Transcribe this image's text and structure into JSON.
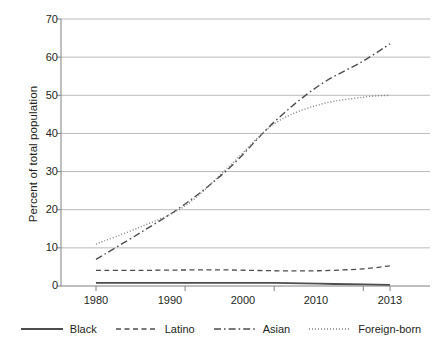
{
  "chart_data": {
    "type": "line",
    "title": "",
    "xlabel": "",
    "ylabel": "Percent of total population",
    "xlim": [
      1980,
      2013
    ],
    "ylim": [
      0,
      70
    ],
    "yticks": [
      0,
      10,
      20,
      30,
      40,
      50,
      60,
      70
    ],
    "xticks": [
      1980,
      1990,
      2000,
      2010,
      2013
    ],
    "grid": "horizontal",
    "legend_position": "bottom",
    "x": [
      1980,
      1985,
      1990,
      1995,
      2000,
      2005,
      2010,
      2013
    ],
    "series": [
      {
        "name": "Black",
        "style": "solid",
        "color": "#4d4d4d",
        "values": [
          0.8,
          0.8,
          0.8,
          0.8,
          0.8,
          0.6,
          0.4,
          0.3
        ]
      },
      {
        "name": "Latino",
        "style": "dashed",
        "color": "#4d4d4d",
        "values": [
          4.1,
          4.1,
          4.2,
          4.2,
          4.0,
          4.0,
          4.5,
          5.3
        ]
      },
      {
        "name": "Asian",
        "style": "dashdot",
        "color": "#4d4d4d",
        "values": [
          7.0,
          14.0,
          21.5,
          31.0,
          43.0,
          52.5,
          59.0,
          63.5
        ]
      },
      {
        "name": "Foreign-born",
        "style": "dotted",
        "color": "#808080",
        "values": [
          11.0,
          15.5,
          21.0,
          31.5,
          42.5,
          47.5,
          49.5,
          50.0
        ]
      }
    ]
  },
  "axis": {
    "ylabel": "Percent of total population",
    "ytick_labels": [
      "0",
      "10",
      "20",
      "30",
      "40",
      "50",
      "60",
      "70"
    ],
    "xtick_labels": [
      "1980",
      "1990",
      "2000",
      "2010",
      "2013"
    ]
  },
  "legend": {
    "items": [
      {
        "label": "Black",
        "style": "solid"
      },
      {
        "label": "Latino",
        "style": "dashed"
      },
      {
        "label": "Asian",
        "style": "dashdot"
      },
      {
        "label": "Foreign-born",
        "style": "dotted"
      }
    ]
  },
  "colors": {
    "line_dark": "#4d4d4d",
    "line_light": "#808080",
    "grid": "#b3b3b3",
    "axis": "#808080",
    "text": "#231f20",
    "background": "#ffffff"
  }
}
